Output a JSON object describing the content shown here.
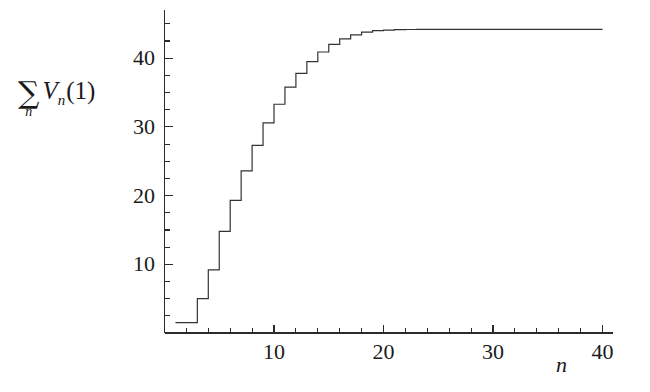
{
  "chart_data": {
    "type": "line",
    "title": "",
    "subtitle": "",
    "xlabel": "n",
    "ylabel_parts": {
      "sum_symbol": "∑",
      "sum_subscript": "n",
      "function": "V",
      "function_subscript": "n",
      "argument": "(1)"
    },
    "ylabel": "∑n Vn(1)",
    "grid": false,
    "legend": null,
    "line_style": "step-post",
    "line_color": "#333333",
    "line_width": 1.2,
    "xlim": [
      0,
      41
    ],
    "ylim": [
      0,
      47
    ],
    "x_major_ticks": [
      10,
      20,
      30,
      40
    ],
    "x_major_tick_labels": [
      "10",
      "20",
      "30",
      "40"
    ],
    "x_minor_tick_step": 2,
    "y_major_ticks": [
      10,
      20,
      30,
      40
    ],
    "y_major_tick_labels": [
      "10",
      "20",
      "30",
      "40"
    ],
    "y_minor_tick_step": 2.5,
    "axis_color": "#2b2b2b",
    "background": "#ffffff",
    "x": [
      1,
      2,
      3,
      4,
      5,
      6,
      7,
      8,
      9,
      10,
      11,
      12,
      13,
      14,
      15,
      16,
      17,
      18,
      19,
      20,
      21,
      22,
      23,
      24,
      25,
      26,
      27,
      28,
      29,
      30,
      31,
      32,
      33,
      34,
      35,
      36,
      37,
      38,
      39,
      40
    ],
    "values": [
      1.5,
      1.5,
      5.0,
      9.2,
      14.8,
      19.3,
      23.6,
      27.3,
      30.6,
      33.3,
      35.8,
      37.8,
      39.5,
      40.9,
      42.0,
      42.8,
      43.4,
      43.8,
      44.0,
      44.1,
      44.15,
      44.18,
      44.2,
      44.2,
      44.2,
      44.2,
      44.2,
      44.2,
      44.2,
      44.2,
      44.2,
      44.2,
      44.2,
      44.2,
      44.2,
      44.2,
      44.2,
      44.2,
      44.2,
      44.2
    ],
    "annotations": []
  }
}
